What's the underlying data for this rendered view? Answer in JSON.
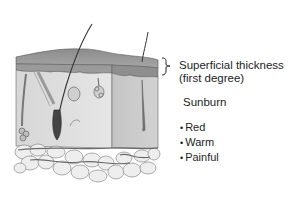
{
  "figure": {
    "annotation": {
      "bracket_label_line1": "Superficial thickness",
      "bracket_label_line2": "(first degree)"
    },
    "condition_title": "Sunburn",
    "symptoms": [
      "Red",
      "Warm",
      "Painful"
    ]
  },
  "colors": {
    "background": "#ffffff",
    "text": "#1e1e1e",
    "epidermis": "#8a8a8a",
    "dermis": "#d8d8d8",
    "fat": "#ececec",
    "line": "#555555"
  }
}
